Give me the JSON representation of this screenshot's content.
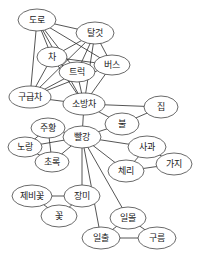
{
  "diagram": {
    "type": "semantic-network",
    "nodes": [
      {
        "id": "road",
        "label": "도로"
      },
      {
        "id": "vehicle",
        "label": "탈것"
      },
      {
        "id": "car",
        "label": "차"
      },
      {
        "id": "truck",
        "label": "트럭"
      },
      {
        "id": "bus",
        "label": "버스"
      },
      {
        "id": "ambulance",
        "label": "구급차"
      },
      {
        "id": "firetruck",
        "label": "소방차"
      },
      {
        "id": "house",
        "label": "집"
      },
      {
        "id": "fire",
        "label": "불"
      },
      {
        "id": "orange",
        "label": "주황"
      },
      {
        "id": "red",
        "label": "빨강"
      },
      {
        "id": "yellow",
        "label": "노랑"
      },
      {
        "id": "apple",
        "label": "사과"
      },
      {
        "id": "green",
        "label": "초록"
      },
      {
        "id": "cherry",
        "label": "체리"
      },
      {
        "id": "eggplant",
        "label": "가지"
      },
      {
        "id": "violet",
        "label": "제비꽃"
      },
      {
        "id": "rose",
        "label": "장미"
      },
      {
        "id": "flower",
        "label": "꽃"
      },
      {
        "id": "sunset",
        "label": "일몰"
      },
      {
        "id": "sunrise",
        "label": "일출"
      },
      {
        "id": "cloud",
        "label": "구름"
      }
    ],
    "edges": [
      [
        "road",
        "vehicle"
      ],
      [
        "road",
        "car"
      ],
      [
        "road",
        "truck"
      ],
      [
        "road",
        "bus"
      ],
      [
        "road",
        "ambulance"
      ],
      [
        "road",
        "firetruck"
      ],
      [
        "vehicle",
        "car"
      ],
      [
        "vehicle",
        "truck"
      ],
      [
        "vehicle",
        "bus"
      ],
      [
        "vehicle",
        "ambulance"
      ],
      [
        "vehicle",
        "firetruck"
      ],
      [
        "car",
        "bus"
      ],
      [
        "car",
        "ambulance"
      ],
      [
        "car",
        "firetruck"
      ],
      [
        "truck",
        "ambulance"
      ],
      [
        "truck",
        "firetruck"
      ],
      [
        "bus",
        "ambulance"
      ],
      [
        "bus",
        "firetruck"
      ],
      [
        "ambulance",
        "firetruck"
      ],
      [
        "firetruck",
        "house"
      ],
      [
        "firetruck",
        "fire"
      ],
      [
        "firetruck",
        "red"
      ],
      [
        "house",
        "fire"
      ],
      [
        "fire",
        "red"
      ],
      [
        "red",
        "orange"
      ],
      [
        "red",
        "yellow"
      ],
      [
        "red",
        "green"
      ],
      [
        "red",
        "apple"
      ],
      [
        "red",
        "cherry"
      ],
      [
        "red",
        "rose"
      ],
      [
        "red",
        "sunset"
      ],
      [
        "red",
        "sunrise"
      ],
      [
        "orange",
        "yellow"
      ],
      [
        "orange",
        "green"
      ],
      [
        "yellow",
        "green"
      ],
      [
        "apple",
        "cherry"
      ],
      [
        "apple",
        "eggplant"
      ],
      [
        "cherry",
        "eggplant"
      ],
      [
        "violet",
        "rose"
      ],
      [
        "violet",
        "flower"
      ],
      [
        "rose",
        "flower"
      ],
      [
        "sunset",
        "sunrise"
      ],
      [
        "sunset",
        "cloud"
      ],
      [
        "sunrise",
        "cloud"
      ]
    ]
  }
}
